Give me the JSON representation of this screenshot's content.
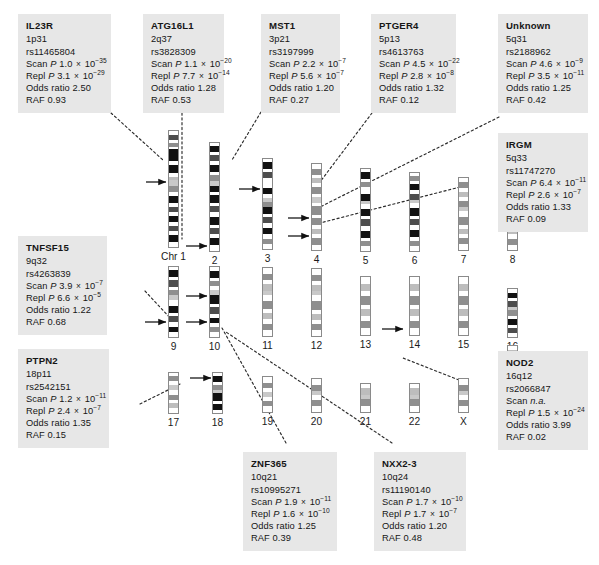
{
  "figure": {
    "type": "karyotype-annotation-diagram",
    "box_background": "#e7e7e7",
    "band_colors": {
      "gneg": "#ffffff",
      "gpos25": "#bdbdbd",
      "gpos50": "#8f8f8f",
      "gpos75": "#4d4d4d",
      "gpos100": "#111111",
      "acen": "#c9c9c9",
      "outline": "#8a8a8a"
    }
  },
  "gene_boxes": [
    {
      "id": "il23r",
      "gene": "IL23R",
      "cytoband": "1p31",
      "snp": "rs11465804",
      "scan_label": "Scan",
      "scan_p_prefix": "P",
      "scan_p_mantissa": "1.0",
      "scan_p_exponent": "−35",
      "repl_label": "Repl",
      "repl_p_prefix": "P",
      "repl_p_mantissa": "3.1",
      "repl_p_exponent": "−29",
      "odds_label": "Odds ratio",
      "odds_ratio": "2.50",
      "raf_label": "RAF",
      "raf": "0.93"
    },
    {
      "id": "atg16l1",
      "gene": "ATG16L1",
      "cytoband": "2q37",
      "snp": "rs3828309",
      "scan_label": "Scan",
      "scan_p_prefix": "P",
      "scan_p_mantissa": "1.1",
      "scan_p_exponent": "−20",
      "repl_label": "Repl",
      "repl_p_prefix": "P",
      "repl_p_mantissa": "7.7",
      "repl_p_exponent": "−14",
      "odds_label": "Odds ratio",
      "odds_ratio": "1.28",
      "raf_label": "RAF",
      "raf": "0.53"
    },
    {
      "id": "mst1",
      "gene": "MST1",
      "cytoband": "3p21",
      "snp": "rs3197999",
      "scan_label": "Scan",
      "scan_p_prefix": "P",
      "scan_p_mantissa": "2.2",
      "scan_p_exponent": "−7",
      "repl_label": "Repl",
      "repl_p_prefix": "P",
      "repl_p_mantissa": "5.6",
      "repl_p_exponent": "−7",
      "odds_label": "Odds ratio",
      "odds_ratio": "1.20",
      "raf_label": "RAF",
      "raf": "0.27"
    },
    {
      "id": "ptger4",
      "gene": "PTGER4",
      "cytoband": "5p13",
      "snp": "rs4613763",
      "scan_label": "Scan",
      "scan_p_prefix": "P",
      "scan_p_mantissa": "4.5",
      "scan_p_exponent": "−22",
      "repl_label": "Repl",
      "repl_p_prefix": "P",
      "repl_p_mantissa": "2.8",
      "repl_p_exponent": "−8",
      "odds_label": "Odds ratio",
      "odds_ratio": "1.32",
      "raf_label": "RAF",
      "raf": "0.12"
    },
    {
      "id": "unknown",
      "gene": "Unknown",
      "cytoband": "5q31",
      "snp": "rs2188962",
      "scan_label": "Scan",
      "scan_p_prefix": "P",
      "scan_p_mantissa": "4.6",
      "scan_p_exponent": "−9",
      "repl_label": "Repl",
      "repl_p_prefix": "P",
      "repl_p_mantissa": "3.5",
      "repl_p_exponent": "−11",
      "odds_label": "Odds ratio",
      "odds_ratio": "1.25",
      "raf_label": "RAF",
      "raf": "0.42"
    },
    {
      "id": "irgm",
      "gene": "IRGM",
      "cytoband": "5q33",
      "snp": "rs11747270",
      "scan_label": "Scan",
      "scan_p_prefix": "P",
      "scan_p_mantissa": "6.4",
      "scan_p_exponent": "−11",
      "repl_label": "Repl",
      "repl_p_prefix": "P",
      "repl_p_mantissa": "2.6",
      "repl_p_exponent": "−7",
      "odds_label": "Odds ratio",
      "odds_ratio": "1.33",
      "raf_label": "RAF",
      "raf": "0.09"
    },
    {
      "id": "tnfsf15",
      "gene": "TNFSF15",
      "cytoband": "9q32",
      "snp": "rs4263839",
      "scan_label": "Scan",
      "scan_p_prefix": "P",
      "scan_p_mantissa": "3.9",
      "scan_p_exponent": "−7",
      "repl_label": "Repl",
      "repl_p_prefix": "P",
      "repl_p_mantissa": "6.6",
      "repl_p_exponent": "−5",
      "odds_label": "Odds ratio",
      "odds_ratio": "1.22",
      "raf_label": "RAF",
      "raf": "0.68"
    },
    {
      "id": "ptpn2",
      "gene": "PTPN2",
      "cytoband": "18p11",
      "snp": "rs2542151",
      "scan_label": "Scan",
      "scan_p_prefix": "P",
      "scan_p_mantissa": "1.2",
      "scan_p_exponent": "−11",
      "repl_label": "Repl",
      "repl_p_prefix": "P",
      "repl_p_mantissa": "2.4",
      "repl_p_exponent": "−7",
      "odds_label": "Odds ratio",
      "odds_ratio": "1.35",
      "raf_label": "RAF",
      "raf": "0.15"
    },
    {
      "id": "nod2",
      "gene": "NOD2",
      "cytoband": "16q12",
      "snp": "rs2066847",
      "scan_label": "Scan",
      "scan_na": "n.a.",
      "repl_label": "Repl",
      "repl_p_prefix": "P",
      "repl_p_mantissa": "1.5",
      "repl_p_exponent": "−24",
      "odds_label": "Odds ratio",
      "odds_ratio": "3.99",
      "raf_label": "RAF",
      "raf": "0.02"
    },
    {
      "id": "znf365",
      "gene": "ZNF365",
      "cytoband": "10q21",
      "snp": "rs10995271",
      "scan_label": "Scan",
      "scan_p_prefix": "P",
      "scan_p_mantissa": "1.9",
      "scan_p_exponent": "−11",
      "repl_label": "Repl",
      "repl_p_prefix": "P",
      "repl_p_mantissa": "1.6",
      "repl_p_exponent": "−10",
      "odds_label": "Odds ratio",
      "odds_ratio": "1.25",
      "raf_label": "RAF",
      "raf": "0.39"
    },
    {
      "id": "nxx23",
      "gene": "NXX2-3",
      "cytoband": "10q24",
      "snp": "rs11190140",
      "scan_label": "Scan",
      "scan_p_prefix": "P",
      "scan_p_mantissa": "1.7",
      "scan_p_exponent": "−10",
      "repl_label": "Repl",
      "repl_p_prefix": "P",
      "repl_p_mantissa": "1.7",
      "repl_p_exponent": "−7",
      "odds_label": "Odds ratio",
      "odds_ratio": "1.20",
      "raf_label": "RAF",
      "raf": "0.48"
    }
  ],
  "chromosomes": [
    {
      "id": "chr1",
      "label": "Chr 1"
    },
    {
      "id": "chr2",
      "label": "2"
    },
    {
      "id": "chr3",
      "label": "3"
    },
    {
      "id": "chr4",
      "label": "4"
    },
    {
      "id": "chr5",
      "label": "5"
    },
    {
      "id": "chr6",
      "label": "6"
    },
    {
      "id": "chr7",
      "label": "7"
    },
    {
      "id": "chr8",
      "label": "8"
    },
    {
      "id": "chr9",
      "label": "9"
    },
    {
      "id": "chr10",
      "label": "10"
    },
    {
      "id": "chr11",
      "label": "11"
    },
    {
      "id": "chr12",
      "label": "12"
    },
    {
      "id": "chr13",
      "label": "13"
    },
    {
      "id": "chr14",
      "label": "14"
    },
    {
      "id": "chr15",
      "label": "15"
    },
    {
      "id": "chr16",
      "label": "16"
    },
    {
      "id": "chr17",
      "label": "17"
    },
    {
      "id": "chr18",
      "label": "18"
    },
    {
      "id": "chr19",
      "label": "19"
    },
    {
      "id": "chr20",
      "label": "20"
    },
    {
      "id": "chr21",
      "label": "21"
    },
    {
      "id": "chr22",
      "label": "22"
    },
    {
      "id": "chrX",
      "label": "X"
    },
    {
      "id": "chrY",
      "label": "Y"
    }
  ]
}
